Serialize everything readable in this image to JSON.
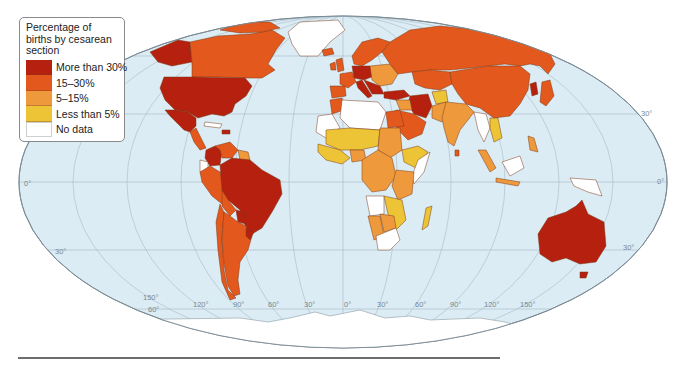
{
  "legend": {
    "title": "Percentage of births by cesarean section",
    "items": [
      {
        "label": "More than 30%",
        "color": "#b5200f"
      },
      {
        "label": "15–30%",
        "color": "#e3581c"
      },
      {
        "label": "5–15%",
        "color": "#ee9a3c"
      },
      {
        "label": "Less than 5%",
        "color": "#ecc436"
      },
      {
        "label": "No data",
        "color": "#ffffff"
      }
    ]
  },
  "colors": {
    "ocean": "#dcecf4",
    "graticule": "#9fb3bf",
    "outline": "#7a8a94",
    "border": "#7b3b1a",
    "antarctica": "#ffffff"
  },
  "graticule_labels": {
    "lat": [
      "30°",
      "0°",
      "30°",
      "30°",
      "0°",
      "30°",
      "60°"
    ],
    "lon": [
      "150°",
      "120°",
      "90°",
      "60°",
      "30°",
      "0°",
      "30°",
      "60°",
      "90°",
      "120°",
      "150°"
    ]
  },
  "map": {
    "title": "World map of cesarean section birth rates",
    "categories": [
      "More than 30%",
      "15–30%",
      "5–15%",
      "Less than 5%",
      "No data"
    ]
  }
}
